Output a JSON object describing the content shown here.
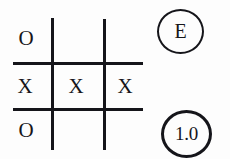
{
  "figure": {
    "kind": "tic-tac-toe-board-with-annotations",
    "background_color": "#fdfdfd",
    "ink_color": "#16161a"
  },
  "board": {
    "rows": 3,
    "columns": 3,
    "cells": [
      [
        {
          "id": "r0c0",
          "mark": "O"
        },
        {
          "id": "r0c1",
          "mark": ""
        },
        {
          "id": "r0c2",
          "mark": ""
        }
      ],
      [
        {
          "id": "r1c0",
          "mark": "X"
        },
        {
          "id": "r1c1",
          "mark": "X"
        },
        {
          "id": "r1c2",
          "mark": "X"
        }
      ],
      [
        {
          "id": "r2c0",
          "mark": "O"
        },
        {
          "id": "r2c1",
          "mark": ""
        },
        {
          "id": "r2c2",
          "mark": ""
        }
      ]
    ]
  },
  "annotations": {
    "letter_badge": {
      "label": "E",
      "shape": "circle",
      "border_color": "#15151a"
    },
    "value_badge": {
      "label": "1.0",
      "shape": "circle",
      "border_color": "#15151a"
    }
  }
}
